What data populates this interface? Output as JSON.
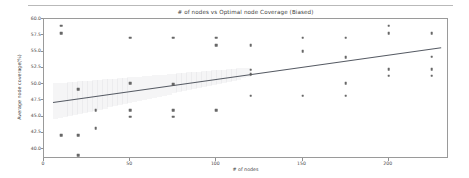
{
  "chart_data": {
    "type": "scatter",
    "title": "# of nodes vs Optimal node Coverage (Biased)",
    "xlabel": "# of nodes",
    "ylabel": "Average node coverage(%)",
    "xlim": [
      0,
      235
    ],
    "ylim": [
      38.5,
      60.0
    ],
    "xticks": [
      0,
      50,
      100,
      150,
      200
    ],
    "xtick_labels": [
      "0",
      "50",
      "100",
      "150",
      "200"
    ],
    "yticks": [
      40.0,
      42.5,
      45.0,
      47.5,
      50.0,
      52.5,
      55.0,
      57.5,
      60.0
    ],
    "ytick_labels": [
      "40.0",
      "42.5",
      "45.0",
      "47.5",
      "50.0",
      "52.5",
      "55.0",
      "57.5",
      "60.0"
    ],
    "grid": false,
    "legend": null,
    "marker_color": "#5a5a5a",
    "line_color": "#555a63",
    "band_color": "#9aa0a8",
    "x": [
      10,
      10,
      10,
      20,
      20,
      20,
      30,
      30,
      50,
      50,
      50,
      50,
      75,
      75,
      75,
      75,
      100,
      100,
      100,
      120,
      120,
      120,
      120,
      150,
      150,
      150,
      175,
      175,
      175,
      175,
      200,
      200,
      200,
      200,
      225,
      225,
      225,
      225
    ],
    "y": [
      59.0,
      57.8,
      42.2,
      49.2,
      42.2,
      39.1,
      46.0,
      43.2,
      57.1,
      50.1,
      46.0,
      45.0,
      57.1,
      50.0,
      46.0,
      45.0,
      57.1,
      56.0,
      46.0,
      56.0,
      52.2,
      51.5,
      48.2,
      57.1,
      55.1,
      48.2,
      57.1,
      54.1,
      50.1,
      48.2,
      59.0,
      57.8,
      52.3,
      51.3,
      57.8,
      54.2,
      52.3,
      51.3
    ],
    "series_name": "observations",
    "trend": {
      "type": "linear-regression",
      "x_start": 5,
      "y_start": 47.2,
      "x_end": 230,
      "y_end": 55.6
    },
    "confidence_band": {
      "x_start": 5,
      "x_end": 120,
      "y_upper_start": 50.1,
      "y_lower_start": 44.6,
      "y_upper_end": 52.6,
      "y_lower_end": 51.2
    }
  }
}
